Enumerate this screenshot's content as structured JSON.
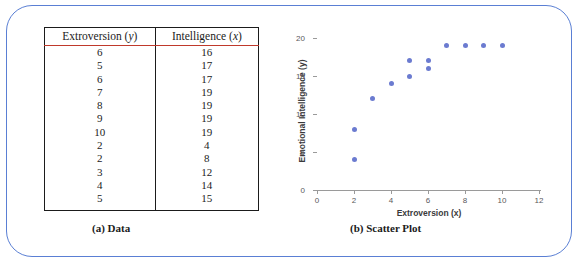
{
  "figure": {
    "panel_a_caption": "(a) Data",
    "panel_b_caption": "(b) Scatter Plot",
    "frame_color": "#5a7fd4",
    "header_rule_color": "#c0392b"
  },
  "table": {
    "headers": [
      "Extroversion (y)",
      "Intelligence (x)"
    ],
    "header_parts": [
      {
        "name": "Extroversion",
        "symbol": "y"
      },
      {
        "name": "Intelligence",
        "symbol": "x"
      }
    ],
    "rows": [
      [
        "6",
        "16"
      ],
      [
        "5",
        "17"
      ],
      [
        "6",
        "17"
      ],
      [
        "7",
        "19"
      ],
      [
        "8",
        "19"
      ],
      [
        "9",
        "19"
      ],
      [
        "10",
        "19"
      ],
      [
        "2",
        "4"
      ],
      [
        "2",
        "8"
      ],
      [
        "3",
        "12"
      ],
      [
        "4",
        "14"
      ],
      [
        "5",
        "15"
      ]
    ]
  },
  "chart_data": {
    "type": "scatter",
    "title": "",
    "xlabel": "Extroversion (x)",
    "ylabel": "Emotional Intelligence (y)",
    "xlim": [
      0,
      12
    ],
    "ylim": [
      0,
      20
    ],
    "xticks": [
      0,
      2,
      4,
      6,
      8,
      10,
      12
    ],
    "yticks": [
      0,
      5,
      10,
      15,
      20
    ],
    "grid": false,
    "legend": false,
    "marker_color": "#6b7bd0",
    "x": [
      6,
      5,
      6,
      7,
      8,
      9,
      10,
      2,
      2,
      3,
      4,
      5
    ],
    "y": [
      16,
      17,
      17,
      19,
      19,
      19,
      19,
      4,
      8,
      12,
      14,
      15
    ],
    "points": [
      {
        "x": 6,
        "y": 16
      },
      {
        "x": 5,
        "y": 17
      },
      {
        "x": 6,
        "y": 17
      },
      {
        "x": 7,
        "y": 19
      },
      {
        "x": 8,
        "y": 19
      },
      {
        "x": 9,
        "y": 19
      },
      {
        "x": 10,
        "y": 19
      },
      {
        "x": 2,
        "y": 4
      },
      {
        "x": 2,
        "y": 8
      },
      {
        "x": 3,
        "y": 12
      },
      {
        "x": 4,
        "y": 14
      },
      {
        "x": 5,
        "y": 15
      }
    ]
  }
}
